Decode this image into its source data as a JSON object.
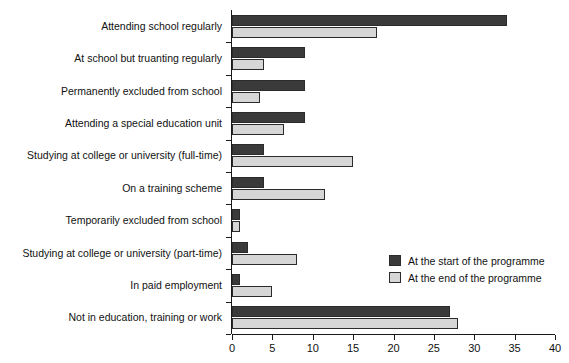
{
  "chart_data": {
    "type": "bar",
    "orientation": "horizontal",
    "title": "",
    "xlabel": "",
    "ylabel": "",
    "xlim": [
      0,
      40
    ],
    "xticks": [
      0,
      5,
      10,
      15,
      20,
      25,
      30,
      35,
      40
    ],
    "grid": false,
    "legend_position": "lower-right",
    "categories": [
      "Attending school regularly",
      "At school but truanting regularly",
      "Permanently excluded from school",
      "Attending a special education unit",
      "Studying at college or university (full-time)",
      "On a training scheme",
      "Temporarily excluded from school",
      "Studying at college or university (part-time)",
      "In paid employment",
      "Not in education, training or work"
    ],
    "series": [
      {
        "name": "At the start of the programme",
        "color": "#3a3a3a",
        "values": [
          34,
          9,
          9,
          9,
          4,
          4,
          1,
          2,
          1,
          27
        ]
      },
      {
        "name": "At the end of the programme",
        "color": "#d6d6d6",
        "values": [
          18,
          4,
          3.5,
          6.5,
          15,
          11.5,
          1,
          8,
          5,
          28
        ]
      }
    ]
  },
  "legend": {
    "items": [
      {
        "label": "At the start of the programme",
        "swatch": "start"
      },
      {
        "label": "At the end of the programme",
        "swatch": "end"
      }
    ]
  }
}
